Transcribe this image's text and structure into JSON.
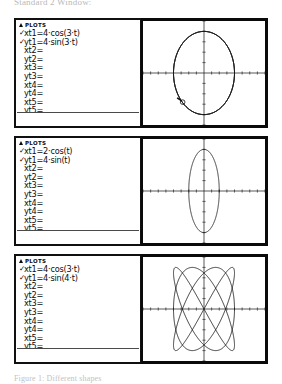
{
  "page": {
    "heading": "Standard 2 Window:",
    "caption": "Figure 1: Different shapes"
  },
  "panels": [
    {
      "id": "panel-1",
      "title": "PLOTS",
      "rows": [
        {
          "check": "✓",
          "text": "xt1=4·cos(3·t)"
        },
        {
          "check": "✓",
          "text": "yt1=4·sin(3·t)"
        },
        {
          "check": "",
          "text": "xt2="
        },
        {
          "check": "",
          "text": "yt2="
        },
        {
          "check": "",
          "text": "xt3="
        },
        {
          "check": "",
          "text": "yt3="
        },
        {
          "check": "",
          "text": "xt4="
        },
        {
          "check": "",
          "text": "yt4="
        },
        {
          "check": "",
          "text": "xt5="
        },
        {
          "check": "",
          "text": "yt5="
        }
      ],
      "graph": {
        "curve": "circle",
        "x_amplitude": 4,
        "y_amplitude": 4,
        "x_freq": 3,
        "y_freq": 3,
        "cursor": {
          "visible": true,
          "x": -2.8,
          "y": -2.8
        }
      }
    },
    {
      "id": "panel-2",
      "title": "PLOTS",
      "rows": [
        {
          "check": "✓",
          "text": "xt1=2·cos(t)"
        },
        {
          "check": "✓",
          "text": "yt1=4·sin(t)"
        },
        {
          "check": "",
          "text": "xt2="
        },
        {
          "check": "",
          "text": "yt2="
        },
        {
          "check": "",
          "text": "xt3="
        },
        {
          "check": "",
          "text": "yt3="
        },
        {
          "check": "",
          "text": "xt4="
        },
        {
          "check": "",
          "text": "yt4="
        },
        {
          "check": "",
          "text": "xt5="
        },
        {
          "check": "",
          "text": "yt5="
        }
      ],
      "graph": {
        "curve": "ellipse",
        "x_amplitude": 2,
        "y_amplitude": 4,
        "x_freq": 1,
        "y_freq": 1,
        "cursor": {
          "visible": false,
          "x": 0,
          "y": 0
        }
      }
    },
    {
      "id": "panel-3",
      "title": "PLOTS",
      "rows": [
        {
          "check": "✓",
          "text": "xt1=4·cos(3·t)"
        },
        {
          "check": "✓",
          "text": "yt1=4·sin(4·t)"
        },
        {
          "check": "",
          "text": "xt2="
        },
        {
          "check": "",
          "text": "yt2="
        },
        {
          "check": "",
          "text": "xt3="
        },
        {
          "check": "",
          "text": "yt3="
        },
        {
          "check": "",
          "text": "xt4="
        },
        {
          "check": "",
          "text": "yt4="
        },
        {
          "check": "",
          "text": "xt5="
        },
        {
          "check": "",
          "text": "yt5="
        }
      ],
      "graph": {
        "curve": "lissajous",
        "x_amplitude": 4,
        "y_amplitude": 4,
        "x_freq": 3,
        "y_freq": 4,
        "cursor": {
          "visible": false,
          "x": 0,
          "y": 0
        }
      }
    }
  ],
  "chart_data": {
    "type": "line",
    "xlabel": "x",
    "ylabel": "y",
    "xlim": [
      -8,
      8
    ],
    "ylim": [
      -5,
      5
    ],
    "grid": false,
    "legend": "none",
    "series": [
      {
        "name": "xt1=4·cos(3·t), yt1=4·sin(3·t)",
        "panel": 1,
        "shape": "circle",
        "x_amplitude": 4,
        "y_amplitude": 4,
        "x_freq": 3,
        "y_freq": 3,
        "phase": 0
      },
      {
        "name": "xt1=2·cos(t), yt1=4·sin(t)",
        "panel": 2,
        "shape": "ellipse",
        "x_amplitude": 2,
        "y_amplitude": 4,
        "x_freq": 1,
        "y_freq": 1,
        "phase": 0
      },
      {
        "name": "xt1=4·cos(3·t), yt1=4·sin(4·t)",
        "panel": 3,
        "shape": "lissajous",
        "x_amplitude": 4,
        "y_amplitude": 4,
        "x_freq": 3,
        "y_freq": 4,
        "phase": 0
      }
    ],
    "axis_ticks": {
      "x_major_every": 1,
      "y_major_every": 1
    }
  }
}
